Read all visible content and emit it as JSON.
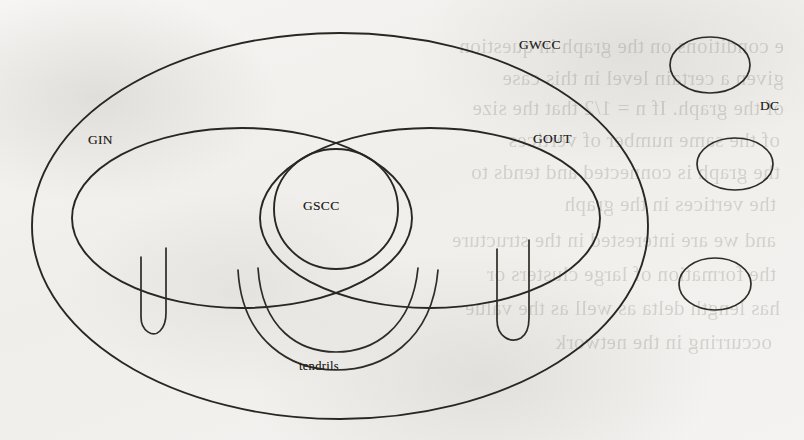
{
  "figure": {
    "kind": "bow-tie-graph-structure-diagram",
    "page_background_color": "#f3f2f0",
    "ink_color": "#2a2722",
    "labels": {
      "gwcc": "GWCC",
      "gin": "GIN",
      "gout": "GOUT",
      "gscc": "GSCC",
      "tendrils": "tendrils",
      "dc": "DC"
    }
  },
  "shapes": {
    "gwcc_ellipse": {
      "cx": 340,
      "cy": 226,
      "rx": 308,
      "ry": 193
    },
    "gin_ellipse": {
      "cx": 242,
      "cy": 218,
      "rx": 170,
      "ry": 90
    },
    "gout_ellipse": {
      "cx": 430,
      "cy": 218,
      "rx": 170,
      "ry": 90
    },
    "gscc_ellipse": {
      "cx": 336,
      "cy": 209,
      "rx": 62,
      "ry": 60
    },
    "disconnected_components": [
      {
        "cx": 710,
        "cy": 65,
        "rx": 40,
        "ry": 28
      },
      {
        "cx": 735,
        "cy": 164,
        "rx": 38,
        "ry": 26
      },
      {
        "cx": 715,
        "cy": 284,
        "rx": 36,
        "ry": 26
      }
    ],
    "tendril_fingers": [
      {
        "side": "left",
        "x1": 140,
        "x2": 166,
        "top": 258,
        "bottom": 332
      },
      {
        "side": "right",
        "x1": 496,
        "x2": 528,
        "top": 252,
        "bottom": 340
      }
    ],
    "tendril_tube": {
      "note": "double-arc tube hanging below GSCC joining GIN and GOUT"
    }
  },
  "label_positions": {
    "gwcc": {
      "x": 519,
      "y": 37
    },
    "gin": {
      "x": 88,
      "y": 132
    },
    "gout": {
      "x": 533,
      "y": 131
    },
    "gscc": {
      "x": 303,
      "y": 198
    },
    "tendrils": {
      "x": 299,
      "y": 359
    },
    "dc": {
      "x": 760,
      "y": 98
    }
  },
  "ghost_text_lines": [
    {
      "x": 20,
      "y": 34,
      "text": "e conditions on the graph in question"
    },
    {
      "x": 20,
      "y": 66,
      "text": "given a certain level in this case"
    },
    {
      "x": 20,
      "y": 96,
      "text": "of the graph. If n = 1/2 that the size"
    },
    {
      "x": 24,
      "y": 128,
      "text": "of the same number of vertices"
    },
    {
      "x": 24,
      "y": 160,
      "text": "the graph is connected and tends to"
    },
    {
      "x": 28,
      "y": 192,
      "text": "the vertices in the graph"
    },
    {
      "x": 28,
      "y": 228,
      "text": "and we are interested in the structure"
    },
    {
      "x": 28,
      "y": 262,
      "text": "the formation of large clusters or"
    },
    {
      "x": 24,
      "y": 296,
      "text": "has length delta as well as the value"
    },
    {
      "x": 32,
      "y": 330,
      "text": "occurring in the network"
    }
  ]
}
